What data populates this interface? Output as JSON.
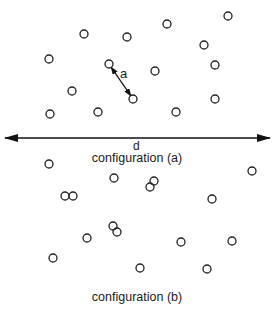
{
  "diagram": {
    "labels": {
      "spacing": "a",
      "width": "d",
      "config_a_caption": "configuration (a)",
      "config_b_caption": "configuration (b)"
    },
    "colors": {
      "stroke": "#222222",
      "background": "#ffffff"
    },
    "circle_radius": 4,
    "configuration_a": {
      "circles": [
        [
          228,
          16
        ],
        [
          167,
          24
        ],
        [
          84,
          34
        ],
        [
          127,
          37
        ],
        [
          204,
          45
        ],
        [
          49,
          59
        ],
        [
          215,
          65
        ],
        [
          109,
          64
        ],
        [
          155,
          71
        ],
        [
          72,
          91
        ],
        [
          133,
          99
        ],
        [
          215,
          99
        ],
        [
          50,
          114
        ],
        [
          98,
          112
        ],
        [
          176,
          112
        ]
      ],
      "spacing_arrow": {
        "from": [
          109,
          64
        ],
        "to": [
          133,
          99
        ]
      }
    },
    "width_arrow": {
      "from": [
        5,
        138
      ],
      "to": [
        270,
        138
      ]
    },
    "configuration_b": {
      "circles": [
        [
          49,
          164
        ],
        [
          252,
          171
        ],
        [
          65,
          196
        ],
        [
          73,
          196
        ],
        [
          114,
          178
        ],
        [
          154,
          181
        ],
        [
          150,
          187
        ],
        [
          212,
          199
        ],
        [
          87,
          238
        ],
        [
          113,
          226
        ],
        [
          117,
          232
        ],
        [
          181,
          242
        ],
        [
          232,
          241
        ],
        [
          53,
          258
        ],
        [
          140,
          268
        ],
        [
          207,
          269
        ]
      ]
    }
  }
}
